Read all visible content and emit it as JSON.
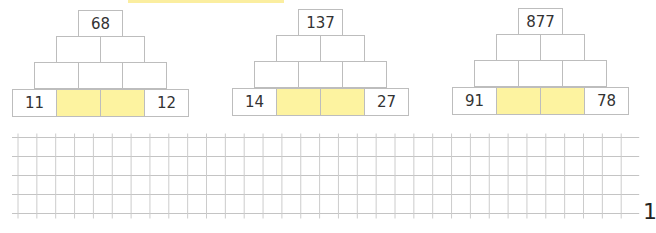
{
  "decor": {
    "top_bar_color": "#fbeea0",
    "highlight_color": "#fdf3a0",
    "border_color": "#bdbdbd"
  },
  "pyramids": [
    {
      "top": "68",
      "row2": [
        "",
        ""
      ],
      "row3": [
        "",
        "",
        ""
      ],
      "base": [
        "11",
        "",
        "",
        "12"
      ]
    },
    {
      "top": "137",
      "row2": [
        "",
        ""
      ],
      "row3": [
        "",
        "",
        ""
      ],
      "base": [
        "14",
        "",
        "",
        "27"
      ]
    },
    {
      "top": "877",
      "row2": [
        "",
        ""
      ],
      "row3": [
        "",
        "",
        ""
      ],
      "base": [
        "91",
        "",
        "",
        "78"
      ]
    }
  ],
  "grid": {
    "rows": 4,
    "columns": 32
  },
  "page_number": "1"
}
